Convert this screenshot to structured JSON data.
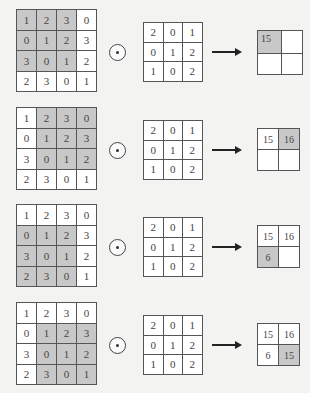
{
  "diagram": {
    "title": "",
    "operator_symbol": "convolution-operator",
    "input_matrix": [
      [
        "1",
        "2",
        "3",
        "0"
      ],
      [
        "0",
        "1",
        "2",
        "3"
      ],
      [
        "3",
        "0",
        "1",
        "2"
      ],
      [
        "2",
        "3",
        "0",
        "1"
      ]
    ],
    "kernel_matrix": [
      [
        "2",
        "0",
        "1"
      ],
      [
        "0",
        "1",
        "2"
      ],
      [
        "1",
        "0",
        "2"
      ]
    ],
    "colors": {
      "highlight": "#c8c8c8",
      "cell_background": "#ffffff",
      "border": "#555555",
      "page_background": "#f3f3f1"
    },
    "steps": [
      {
        "window_position": "top-left",
        "input": [
          [
            "1",
            "2",
            "3",
            "0"
          ],
          [
            "0",
            "1",
            "2",
            "3"
          ],
          [
            "3",
            "0",
            "1",
            "2"
          ],
          [
            "2",
            "3",
            "0",
            "1"
          ]
        ],
        "kernel": [
          [
            "2",
            "0",
            "1"
          ],
          [
            "0",
            "1",
            "2"
          ],
          [
            "1",
            "0",
            "2"
          ]
        ],
        "output": [
          [
            "15",
            ""
          ],
          [
            "",
            ""
          ]
        ],
        "highlight_output": [
          0,
          0
        ]
      },
      {
        "window_position": "top-right",
        "input": [
          [
            "1",
            "2",
            "3",
            "0"
          ],
          [
            "0",
            "1",
            "2",
            "3"
          ],
          [
            "3",
            "0",
            "1",
            "2"
          ],
          [
            "2",
            "3",
            "0",
            "1"
          ]
        ],
        "kernel": [
          [
            "2",
            "0",
            "1"
          ],
          [
            "0",
            "1",
            "2"
          ],
          [
            "1",
            "0",
            "2"
          ]
        ],
        "output": [
          [
            "15",
            "16"
          ],
          [
            "",
            ""
          ]
        ],
        "highlight_output": [
          0,
          1
        ]
      },
      {
        "window_position": "bottom-left",
        "input": [
          [
            "1",
            "2",
            "3",
            "0"
          ],
          [
            "0",
            "1",
            "2",
            "3"
          ],
          [
            "3",
            "0",
            "1",
            "2"
          ],
          [
            "2",
            "3",
            "0",
            "1"
          ]
        ],
        "kernel": [
          [
            "2",
            "0",
            "1"
          ],
          [
            "0",
            "1",
            "2"
          ],
          [
            "1",
            "0",
            "2"
          ]
        ],
        "output": [
          [
            "15",
            "16"
          ],
          [
            "6",
            ""
          ]
        ],
        "highlight_output": [
          1,
          0
        ]
      },
      {
        "window_position": "bottom-right",
        "input": [
          [
            "1",
            "2",
            "3",
            "0"
          ],
          [
            "0",
            "1",
            "2",
            "3"
          ],
          [
            "3",
            "0",
            "1",
            "2"
          ],
          [
            "2",
            "3",
            "0",
            "1"
          ]
        ],
        "kernel": [
          [
            "2",
            "0",
            "1"
          ],
          [
            "0",
            "1",
            "2"
          ],
          [
            "1",
            "0",
            "2"
          ]
        ],
        "output": [
          [
            "15",
            "16"
          ],
          [
            "6",
            "15"
          ]
        ],
        "highlight_output": [
          1,
          1
        ]
      }
    ]
  }
}
